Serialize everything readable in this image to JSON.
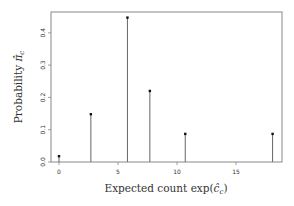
{
  "chart_data": {
    "type": "stem",
    "title": "",
    "xlabel": "Expected count exp(ĉ_c)",
    "ylabel": "Probability π̂_c",
    "xlim": [
      -0.6,
      19.2
    ],
    "ylim": [
      0.0,
      0.465
    ],
    "xticks": [
      0,
      5,
      10,
      15
    ],
    "yticks": [
      0.0,
      0.1,
      0.2,
      0.3,
      0.4
    ],
    "grid": false,
    "legend": null,
    "x": [
      0.0,
      2.7,
      5.8,
      7.7,
      10.7,
      18.1
    ],
    "values": [
      0.018,
      0.148,
      0.447,
      0.22,
      0.087,
      0.087
    ]
  },
  "labels": {
    "xlabel_text": "Expected count exp(",
    "xlabel_var": "ĉ",
    "xlabel_sub": "c",
    "xlabel_close": ")",
    "ylabel_text": "Probability ",
    "ylabel_var": "π̂",
    "ylabel_sub": "c"
  },
  "colors": {
    "axis": "#888888",
    "stem": "#666666",
    "marker": "#111111",
    "text": "#333333"
  }
}
